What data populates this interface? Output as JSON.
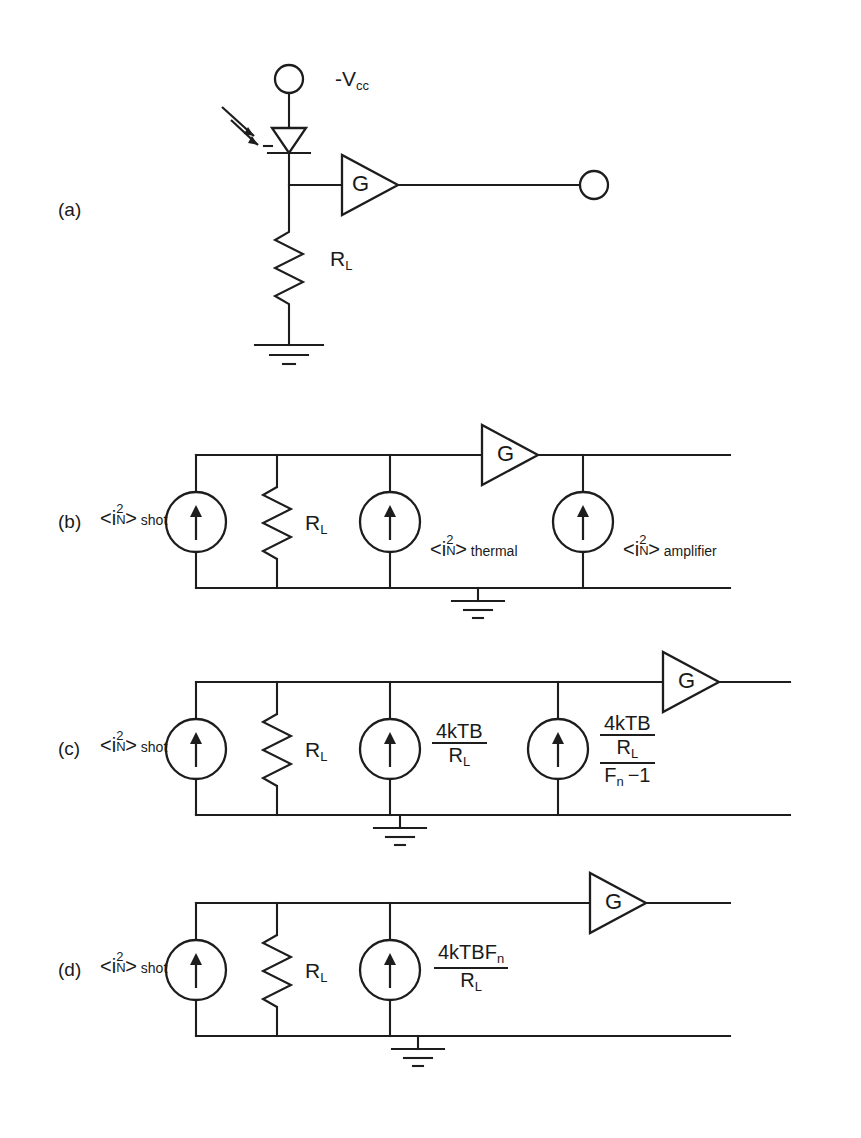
{
  "figure": {
    "type": "circuit-diagram",
    "panels": [
      {
        "tag": "(a)",
        "title": "photodiode receiver front end",
        "labels": {
          "supply": "-V",
          "supply_sub": "cc",
          "load_resistor": "R",
          "load_resistor_sub": "L",
          "amplifier_gain": "G"
        },
        "elements": [
          "optical-input-arrows",
          "photodiode",
          "supply-terminal",
          "load-resistor",
          "amplifier",
          "output-terminal",
          "ground"
        ]
      },
      {
        "tag": "(b)",
        "title": "noise equivalent circuit with named noise sources",
        "labels": {
          "shot": {
            "open": "<",
            "i": "i",
            "sup": "2",
            "sub": "N",
            "close": ">",
            "tag": "shot"
          },
          "thermal": {
            "open": "<",
            "i": "i",
            "sup": "2",
            "sub": "N",
            "close": ">",
            "tag": "thermal"
          },
          "amplifier": {
            "open": "<",
            "i": "i",
            "sup": "2",
            "sub": "N",
            "close": ">",
            "tag": "amplifier"
          },
          "load_resistor": "R",
          "load_resistor_sub": "L",
          "amplifier_gain": "G"
        },
        "sources": 3
      },
      {
        "tag": "(c)",
        "title": "noise equivalent circuit with explicit thermal and amplifier expressions",
        "labels": {
          "shot": {
            "open": "<",
            "i": "i",
            "sup": "2",
            "sub": "N",
            "close": ">",
            "tag": "shot"
          },
          "load_resistor": "R",
          "load_resistor_sub": "L",
          "amplifier_gain": "G"
        },
        "expressions": [
          {
            "numerator": "4kTB",
            "denominator": "R",
            "denominator_sub": "L"
          },
          {
            "numerator": "4kTB",
            "denominator": "R",
            "denominator_sub": "L",
            "denominator2": "F",
            "denominator2_sub": "n",
            "denominator2_tail": "−1"
          }
        ],
        "sources": 3
      },
      {
        "tag": "(d)",
        "title": "combined noise equivalent circuit",
        "labels": {
          "shot": {
            "open": "<",
            "i": "i",
            "sup": "2",
            "sub": "N",
            "close": ">",
            "tag": "shot"
          },
          "load_resistor": "R",
          "load_resistor_sub": "L",
          "amplifier_gain": "G"
        },
        "expressions": [
          {
            "numerator": "4kTBF",
            "numerator_sub": "n",
            "denominator": "R",
            "denominator_sub": "L"
          }
        ],
        "sources": 2
      }
    ],
    "colors": {
      "ink": "#1d1d1d",
      "background": "#ffffff"
    }
  }
}
